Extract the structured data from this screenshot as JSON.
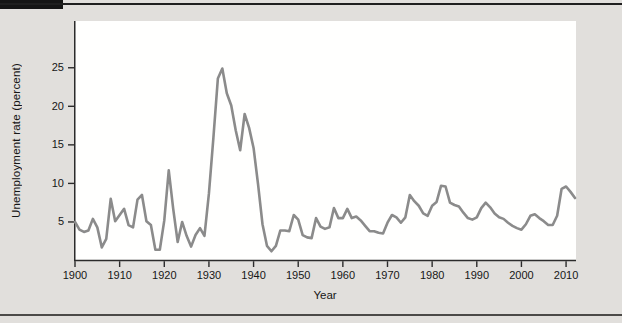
{
  "figure": {
    "background_color": "#e1dfdc",
    "header_bar_color": "#151515",
    "rule_color": "#4b4a48"
  },
  "chart_data": {
    "type": "line",
    "title": "",
    "xlabel": "Year",
    "ylabel": "Unemployment rate (percent)",
    "x_ticks": [
      1900,
      1910,
      1920,
      1930,
      1940,
      1950,
      1960,
      1970,
      1980,
      1990,
      2000,
      2010
    ],
    "y_ticks": [
      5,
      10,
      15,
      20,
      25
    ],
    "xlim": [
      1900,
      2012
    ],
    "ylim": [
      0,
      31
    ],
    "grid": false,
    "legend": "none",
    "line_color": "#8b8b8b",
    "axis_color": "#2b2b2b",
    "plot_background": "#fffffe",
    "series": [
      {
        "name": "U.S. unemployment rate",
        "x_start": 1900,
        "x_step": 1,
        "x": [
          1900,
          1901,
          1902,
          1903,
          1904,
          1905,
          1906,
          1907,
          1908,
          1909,
          1910,
          1911,
          1912,
          1913,
          1914,
          1915,
          1916,
          1917,
          1918,
          1919,
          1920,
          1921,
          1922,
          1923,
          1924,
          1925,
          1926,
          1927,
          1928,
          1929,
          1930,
          1931,
          1932,
          1933,
          1934,
          1935,
          1936,
          1937,
          1938,
          1939,
          1940,
          1941,
          1942,
          1943,
          1944,
          1945,
          1946,
          1947,
          1948,
          1949,
          1950,
          1951,
          1952,
          1953,
          1954,
          1955,
          1956,
          1957,
          1958,
          1959,
          1960,
          1961,
          1962,
          1963,
          1964,
          1965,
          1966,
          1967,
          1968,
          1969,
          1970,
          1971,
          1972,
          1973,
          1974,
          1975,
          1976,
          1977,
          1978,
          1979,
          1980,
          1981,
          1982,
          1983,
          1984,
          1985,
          1986,
          1987,
          1988,
          1989,
          1990,
          1991,
          1992,
          1993,
          1994,
          1995,
          1996,
          1997,
          1998,
          1999,
          2000,
          2001,
          2002,
          2003,
          2004,
          2005,
          2006,
          2007,
          2008,
          2009,
          2010,
          2011,
          2012
        ],
        "values": [
          5.0,
          4.0,
          3.7,
          3.9,
          5.4,
          4.3,
          1.7,
          2.8,
          8.0,
          5.1,
          5.9,
          6.7,
          4.6,
          4.3,
          7.9,
          8.5,
          5.1,
          4.6,
          1.4,
          1.4,
          5.2,
          11.7,
          6.7,
          2.4,
          5.0,
          3.2,
          1.8,
          3.3,
          4.2,
          3.2,
          8.7,
          15.9,
          23.6,
          24.9,
          21.7,
          20.1,
          16.9,
          14.3,
          19.0,
          17.2,
          14.6,
          9.9,
          4.7,
          1.9,
          1.2,
          1.9,
          3.9,
          3.9,
          3.8,
          5.9,
          5.3,
          3.3,
          3.0,
          2.9,
          5.5,
          4.4,
          4.1,
          4.3,
          6.8,
          5.5,
          5.5,
          6.7,
          5.5,
          5.7,
          5.2,
          4.5,
          3.8,
          3.8,
          3.6,
          3.5,
          4.9,
          5.9,
          5.6,
          4.9,
          5.6,
          8.5,
          7.7,
          7.1,
          6.1,
          5.8,
          7.1,
          7.6,
          9.7,
          9.6,
          7.5,
          7.2,
          7.0,
          6.2,
          5.5,
          5.3,
          5.6,
          6.8,
          7.5,
          6.9,
          6.1,
          5.6,
          5.4,
          4.9,
          4.5,
          4.2,
          4.0,
          4.7,
          5.8,
          6.0,
          5.5,
          5.1,
          4.6,
          4.6,
          5.8,
          9.3,
          9.6,
          8.9,
          8.1
        ]
      }
    ]
  }
}
